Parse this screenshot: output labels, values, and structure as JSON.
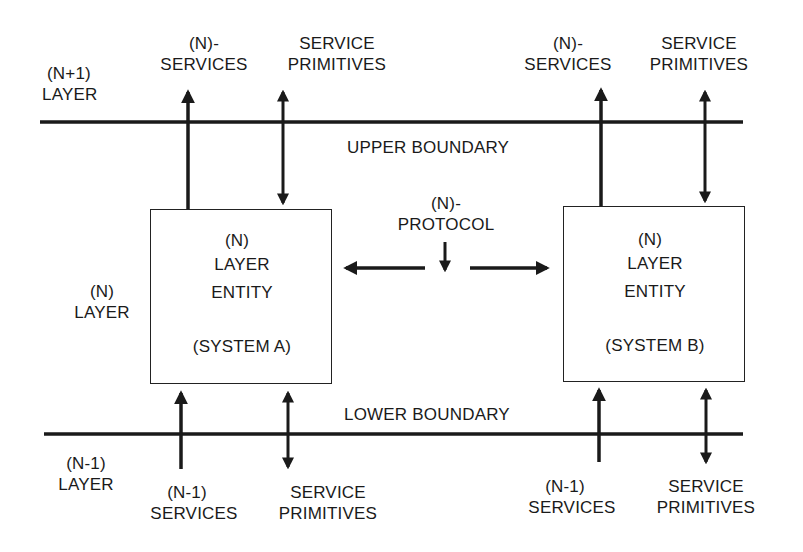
{
  "diagram": {
    "upper_left": {
      "line1": "(N+1)",
      "line2": "LAYER"
    },
    "middle_left": {
      "line1": "(N)",
      "line2": "LAYER"
    },
    "lower_left": {
      "line1": "(N-1)",
      "line2": "LAYER"
    },
    "upper_boundary_label": "UPPER BOUNDARY",
    "lower_boundary_label": "LOWER BOUNDARY",
    "protocol": {
      "line1": "(N)-",
      "line2": "PROTOCOL"
    },
    "system_a": {
      "line1": "(N)",
      "line2": "LAYER",
      "line3": "ENTITY",
      "line4": "(SYSTEM A)",
      "top_services": {
        "line1": "(N)-",
        "line2": "SERVICES"
      },
      "top_primitives": {
        "line1": "SERVICE",
        "line2": "PRIMITIVES"
      },
      "bottom_services": {
        "line1": "(N-1)",
        "line2": "SERVICES"
      },
      "bottom_primitives": {
        "line1": "SERVICE",
        "line2": "PRIMITIVES"
      }
    },
    "system_b": {
      "line1": "(N)",
      "line2": "LAYER",
      "line3": "ENTITY",
      "line4": "(SYSTEM B)",
      "top_services": {
        "line1": "(N)-",
        "line2": "SERVICES"
      },
      "top_primitives": {
        "line1": "SERVICE",
        "line2": "PRIMITIVES"
      },
      "bottom_services": {
        "line1": "(N-1)",
        "line2": "SERVICES"
      },
      "bottom_primitives": {
        "line1": "SERVICE",
        "line2": "PRIMITIVES"
      }
    },
    "colors": {
      "line": "#1a1a1a",
      "background": "#ffffff",
      "text": "#1a1a1a"
    }
  }
}
